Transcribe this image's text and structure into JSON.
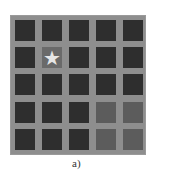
{
  "caption": "a)",
  "grid": {
    "rows": 5,
    "cols": 5,
    "colors": {
      "background": "#8e8e8e",
      "dark": "#2e2e2e",
      "medium": "#5c5c5c",
      "star_cell": "#6a6a6a",
      "star": "#e6e6e6"
    },
    "cells": [
      [
        "dark",
        "dark",
        "dark",
        "dark",
        "dark"
      ],
      [
        "dark",
        "star",
        "dark",
        "dark",
        "dark"
      ],
      [
        "dark",
        "dark",
        "dark",
        "dark",
        "dark"
      ],
      [
        "dark",
        "dark",
        "dark",
        "medium",
        "medium"
      ],
      [
        "dark",
        "dark",
        "dark",
        "medium",
        "medium"
      ]
    ],
    "star_symbol": "★"
  }
}
